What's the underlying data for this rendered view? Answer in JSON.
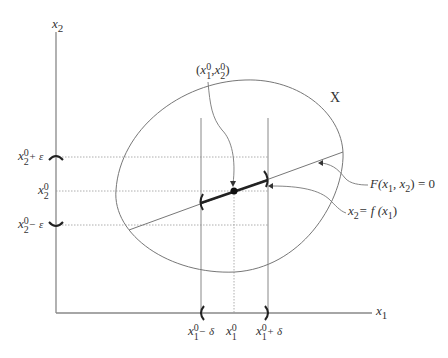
{
  "figure": {
    "type": "implicit-function-theorem-diagram",
    "axes": {
      "x_label": "x",
      "x_label_sub": "1",
      "y_label": "x",
      "y_label_sub": "2"
    },
    "region_label": "X",
    "point_label": {
      "open": "(",
      "x": "x",
      "x_sup": "0",
      "x_sub": "1",
      "sep": ",",
      "y": "x",
      "y_sup": "0",
      "y_sub": "2",
      "close": ")"
    },
    "curve_label": {
      "F": "F",
      "args_open": "(x",
      "sub1": "1",
      "mid": ", x",
      "sub2": "2",
      "args_close": ") = 0"
    },
    "function_label": {
      "lhs": "x",
      "lhs_sub": "2",
      "eq": "= f (x",
      "arg_sub": "1",
      "close": ")"
    },
    "y_ticks": [
      {
        "base": "x",
        "sup": "0",
        "sub": "2",
        "suffix": "+ ε"
      },
      {
        "base": "x",
        "sup": "0",
        "sub": "2",
        "suffix": ""
      },
      {
        "base": "x",
        "sup": "0",
        "sub": "2",
        "suffix": "− ε"
      }
    ],
    "x_ticks": [
      {
        "base": "x",
        "sup": "0",
        "sub": "1",
        "suffix": "− δ"
      },
      {
        "base": "x",
        "sup": "0",
        "sub": "1",
        "suffix": ""
      },
      {
        "base": "x",
        "sup": "0",
        "sub": "1",
        "suffix": "+ δ"
      }
    ],
    "colors": {
      "axis": "#888888",
      "curve": "#777777",
      "highlight": "#222222",
      "text": "#333333"
    }
  }
}
